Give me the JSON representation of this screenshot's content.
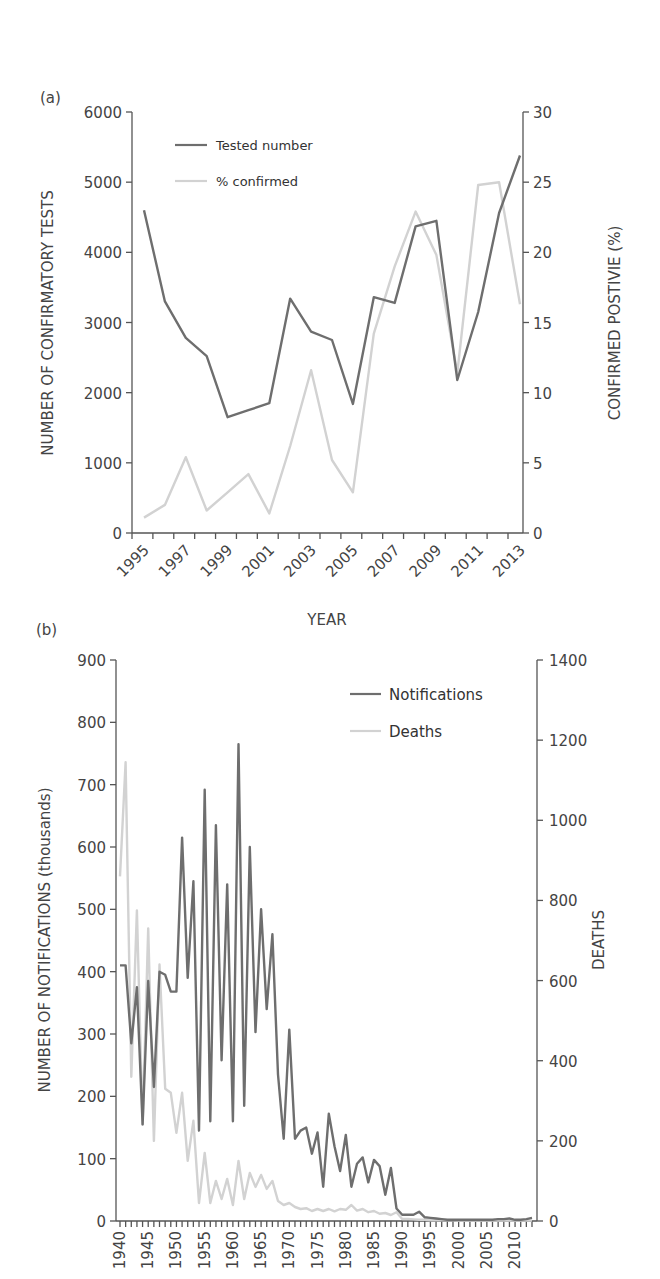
{
  "chart_data": [
    {
      "panel": "(a)",
      "type": "line",
      "title": "",
      "xlabel": "YEAR",
      "ylabel": "NUMBER OF CONFIRMATORY TESTS",
      "y2label": "CONFIRMED POSTIVIE (%)",
      "x": [
        1995,
        1996,
        1997,
        1998,
        1999,
        2000,
        2001,
        2002,
        2003,
        2004,
        2005,
        2006,
        2007,
        2008,
        2009,
        2010,
        2011,
        2012,
        2013
      ],
      "x_tick_labels": [
        "1995",
        "1997",
        "1999",
        "2001",
        "2003",
        "2005",
        "2007",
        "2009",
        "2011",
        "2013"
      ],
      "ylim": [
        0,
        6000
      ],
      "y_ticks": [
        0,
        1000,
        2000,
        3000,
        4000,
        5000,
        6000
      ],
      "y2lim": [
        0,
        30
      ],
      "y2_ticks": [
        0,
        5,
        10,
        15,
        20,
        25,
        30
      ],
      "grid": false,
      "legend_position": "upper left",
      "series": [
        {
          "name": "Tested number",
          "axis": "left",
          "color": "#6e6e6e",
          "values": [
            4600,
            3300,
            2780,
            2520,
            1650,
            1750,
            1850,
            3340,
            2870,
            2750,
            1840,
            3360,
            3280,
            4370,
            4450,
            2180,
            3150,
            4560,
            5380
          ]
        },
        {
          "name": "% confirmed",
          "axis": "right",
          "color": "#d2d2d2",
          "values": [
            1.1,
            2.0,
            5.4,
            1.6,
            2.9,
            4.2,
            1.4,
            6.2,
            11.6,
            5.2,
            2.9,
            14.2,
            19.0,
            22.9,
            19.8,
            11.4,
            24.8,
            25.0,
            16.3
          ]
        }
      ]
    },
    {
      "panel": "(b)",
      "type": "line",
      "title": "",
      "xlabel": "",
      "ylabel": "NUMBER OF NOTIFICATIONS (thousands)",
      "y2label": "DEATHS",
      "x_start": 1940,
      "x_end": 2013,
      "x_tick_labels": [
        "1940",
        "1945",
        "1950",
        "1955",
        "1960",
        "1965",
        "1970",
        "1975",
        "1980",
        "1985",
        "1990",
        "1995",
        "2000",
        "2005",
        "2010"
      ],
      "ylim": [
        0,
        900
      ],
      "y_ticks": [
        0,
        100,
        200,
        300,
        400,
        500,
        600,
        700,
        800,
        900
      ],
      "y2lim": [
        0,
        1400
      ],
      "y2_ticks": [
        0,
        200,
        400,
        600,
        800,
        1000,
        1200,
        1400
      ],
      "grid": false,
      "legend_position": "upper right",
      "series": [
        {
          "name": "Notifications",
          "axis": "left",
          "color": "#6e6e6e",
          "values": [
            410,
            410,
            285,
            375,
            155,
            385,
            215,
            400,
            395,
            368,
            368,
            615,
            390,
            545,
            145,
            692,
            160,
            635,
            258,
            540,
            160,
            765,
            185,
            600,
            303,
            500,
            340,
            460,
            235,
            132,
            307,
            132,
            145,
            150,
            108,
            142,
            55,
            172,
            120,
            80,
            138,
            55,
            92,
            102,
            62,
            98,
            88,
            42,
            85,
            20,
            10,
            10,
            10,
            15,
            6,
            5,
            4,
            3,
            2,
            2,
            2,
            2,
            2,
            2,
            2,
            2,
            2,
            3,
            3,
            4,
            2,
            2,
            3,
            5
          ]
        },
        {
          "name": "Deaths",
          "axis": "right",
          "color": "#d2d2d2",
          "values": [
            860,
            1145,
            360,
            775,
            240,
            730,
            200,
            640,
            330,
            320,
            220,
            320,
            150,
            250,
            45,
            170,
            45,
            100,
            55,
            105,
            40,
            150,
            55,
            120,
            85,
            115,
            80,
            100,
            50,
            40,
            45,
            35,
            30,
            32,
            25,
            30,
            25,
            30,
            24,
            30,
            28,
            40,
            26,
            30,
            22,
            25,
            18,
            20,
            15,
            22,
            5,
            5,
            4,
            3,
            3,
            2,
            2,
            2,
            2,
            2,
            1,
            1,
            1,
            1,
            1,
            1,
            1,
            1,
            1,
            1,
            1,
            1,
            1,
            1
          ]
        }
      ]
    }
  ],
  "panel_a": {
    "label": "(a)",
    "y_axis_title": "NUMBER OF CONFIRMATORY TESTS",
    "y2_axis_title": "CONFIRMED POSTIVIE (%)",
    "x_axis_title": "YEAR",
    "legend": [
      {
        "label": "Tested number",
        "color": "#6e6e6e"
      },
      {
        "label": "% confirmed",
        "color": "#d2d2d2"
      }
    ]
  },
  "panel_b": {
    "label": "(b)",
    "y_axis_title": "NUMBER OF NOTIFICATIONS (thousands)",
    "y2_axis_title": "DEATHS",
    "legend": [
      {
        "label": "Notifications",
        "color": "#6e6e6e"
      },
      {
        "label": "Deaths",
        "color": "#d2d2d2"
      }
    ]
  }
}
